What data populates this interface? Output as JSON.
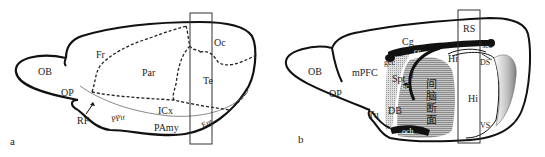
{
  "figure": {
    "panels": [
      {
        "id": "a",
        "panel_label": "a",
        "regions": {
          "OB": "OB",
          "Fr": "Fr",
          "Par": "Par",
          "Oc": "Oc",
          "Te": "Te",
          "OP": "OP",
          "ICx": "ICx",
          "RF": "RF",
          "PPir": "PPir",
          "PAmy": "PAmy",
          "Ent": "Ent"
        }
      },
      {
        "id": "b",
        "panel_label": "b",
        "regions": {
          "OB": "OB",
          "OP": "OP",
          "mPFC": "mPFC",
          "Cg": "Cg",
          "cc": "cc",
          "gcc": "gcc",
          "Spt": "Spt",
          "f": "f",
          "ac": "ac",
          "DB": "DB",
          "Tu": "Tu",
          "och": "och",
          "RS": "RS",
          "scc": "scc",
          "Hi_small": "Hi",
          "DS": "DS",
          "Hi": "Hi",
          "VS": "VS",
          "diencephalon_1": "间",
          "diencephalon_2": "脑",
          "diencephalon_3": "断",
          "diencephalon_4": "面"
        }
      }
    ],
    "colors": {
      "outline": "#111111",
      "dashed": "#222222",
      "shading": "#9a9a9a",
      "light_shading": "#d6d6d6"
    }
  }
}
